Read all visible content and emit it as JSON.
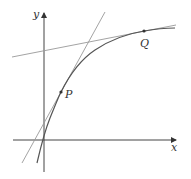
{
  "diagram": {
    "axes": {
      "x_label": "x",
      "y_label": "y"
    },
    "points": [
      {
        "label": "P",
        "x": 61,
        "y": 92
      },
      {
        "label": "Q",
        "x": 144,
        "y": 31
      }
    ],
    "curve": {
      "description": "increasing concave-down curve",
      "color": "#555555"
    },
    "tangent_lines": [
      {
        "at": "P",
        "color": "#999999"
      },
      {
        "at": "Q",
        "color": "#999999"
      }
    ],
    "colors": {
      "axis": "#444444",
      "curve": "#555555",
      "tangent": "#999999",
      "background": "#ffffff"
    }
  }
}
